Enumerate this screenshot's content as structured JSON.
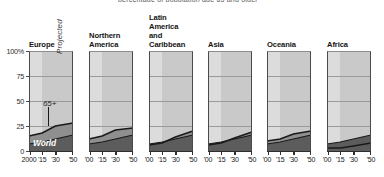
{
  "figure": {
    "clipped_header": "percentage of population age 65 and older",
    "y_axis": {
      "ticks": [
        "100%",
        "75",
        "50",
        "25",
        "0"
      ],
      "values": [
        100,
        75,
        50,
        25,
        0
      ],
      "min": 0,
      "max": 100
    },
    "annotations": {
      "projected": "Projected",
      "series_65plus": "65+",
      "world": "World"
    },
    "colors": {
      "historical_bg": "#dcdcdc",
      "projected_bg": "#c9c9c9",
      "band_65plus": "#8f8f8f",
      "band_world": "#5c5c5c",
      "line": "#1a1a1a",
      "gridline": "#9a9a9a",
      "axis": "#2e2e2e",
      "text": "#141414"
    }
  },
  "chart_data": {
    "type": "area",
    "title": "percentage of population age 65 and older",
    "xlabel": "",
    "ylabel": "",
    "ylim": [
      0,
      100
    ],
    "xlim": [
      2000,
      2050
    ],
    "grid": true,
    "legend_position": "inline-annotation",
    "projection_start_year": 2015,
    "x": [
      2000,
      2015,
      2030,
      2050
    ],
    "x_tick_labels_first_panel": [
      "2000",
      "'15",
      "'30",
      "'50"
    ],
    "x_tick_labels_other_panels": [
      "'00",
      "'15",
      "'30",
      "'50"
    ],
    "panels": [
      {
        "name": "Europe",
        "series": [
          {
            "name": "World",
            "values": [
              7,
              9,
              12,
              16
            ]
          },
          {
            "name": "65+",
            "values": [
              15,
              18,
              25,
              28
            ]
          }
        ]
      },
      {
        "name": "Northern America",
        "series": [
          {
            "name": "World",
            "values": [
              7,
              9,
              12,
              16
            ]
          },
          {
            "name": "65+",
            "values": [
              12,
              15,
              21,
              23
            ]
          }
        ]
      },
      {
        "name": "Latin America and Caribbean",
        "series": [
          {
            "name": "World",
            "values": [
              7,
              9,
              12,
              16
            ]
          },
          {
            "name": "65+",
            "values": [
              6,
              8,
              14,
              20
            ]
          }
        ]
      },
      {
        "name": "Asia",
        "series": [
          {
            "name": "World",
            "values": [
              7,
              9,
              12,
              16
            ]
          },
          {
            "name": "65+",
            "values": [
              6,
              8,
              13,
              19
            ]
          }
        ]
      },
      {
        "name": "Oceania",
        "series": [
          {
            "name": "World",
            "values": [
              7,
              9,
              12,
              16
            ]
          },
          {
            "name": "65+",
            "values": [
              10,
              12,
              17,
              20
            ]
          }
        ]
      },
      {
        "name": "Africa",
        "series": [
          {
            "name": "World",
            "values": [
              7,
              9,
              12,
              16
            ]
          },
          {
            "name": "65+",
            "values": [
              3,
              3,
              5,
              8
            ]
          }
        ]
      }
    ]
  },
  "panel_titles": [
    {
      "lines": [
        "Europe"
      ]
    },
    {
      "lines": [
        "Northern",
        "America"
      ]
    },
    {
      "lines": [
        "Latin",
        "America",
        "and",
        "Caribbean"
      ]
    },
    {
      "lines": [
        "Asia"
      ]
    },
    {
      "lines": [
        "Oceania"
      ]
    },
    {
      "lines": [
        "Africa"
      ]
    }
  ]
}
